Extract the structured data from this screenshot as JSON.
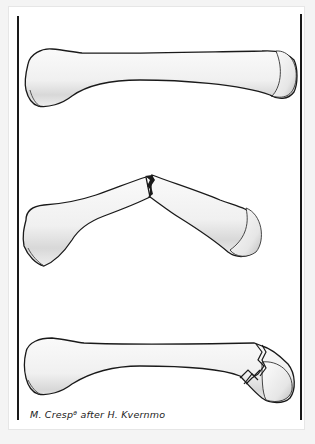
{
  "figure": {
    "panels": [
      {
        "id": "intact",
        "label": "Intact metacarpal bone"
      },
      {
        "id": "angulated-fracture",
        "label": "Angulated shaft fracture"
      },
      {
        "id": "neck-fracture",
        "label": "Comminuted neck fracture"
      }
    ],
    "credit": "M. Crespᶿ after H. Kvernmo",
    "colors": {
      "outline": "#1a1a1a",
      "bone_fill": "#f2f2f2",
      "bone_shade": "#c8c8c8",
      "page": "#ffffff",
      "background": "#f4f4f4"
    }
  }
}
